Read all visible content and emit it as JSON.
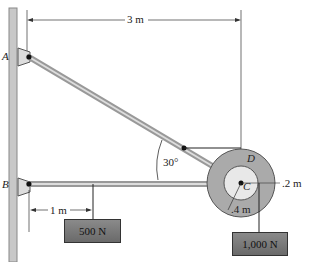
{
  "diagram": {
    "points": {
      "A": "A",
      "B": "B",
      "C": "C",
      "D": "D"
    },
    "dimensions": {
      "span": "3 m",
      "offset": "1 m",
      "outer_radius": ".2 m",
      "inner_radius": ".4 m",
      "angle": "30°"
    },
    "loads": {
      "small": "500 N",
      "large": "1,000 N"
    }
  }
}
